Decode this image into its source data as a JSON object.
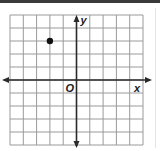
{
  "chart_data": {
    "type": "scatter",
    "title": "",
    "xlabel": "x",
    "ylabel": "y",
    "origin_label": "O",
    "xlim": [
      -5,
      5
    ],
    "ylim": [
      -5,
      5
    ],
    "grid": true,
    "grid_step": 1,
    "tick_labels": false,
    "axes_arrows": true,
    "points": [
      {
        "x": -2,
        "y": 3
      }
    ],
    "legend": null
  },
  "colors": {
    "grid": "#9a9a9a",
    "axis": "#2a2a2a",
    "point": "#111111",
    "top_bar": "#3a3a3a"
  }
}
